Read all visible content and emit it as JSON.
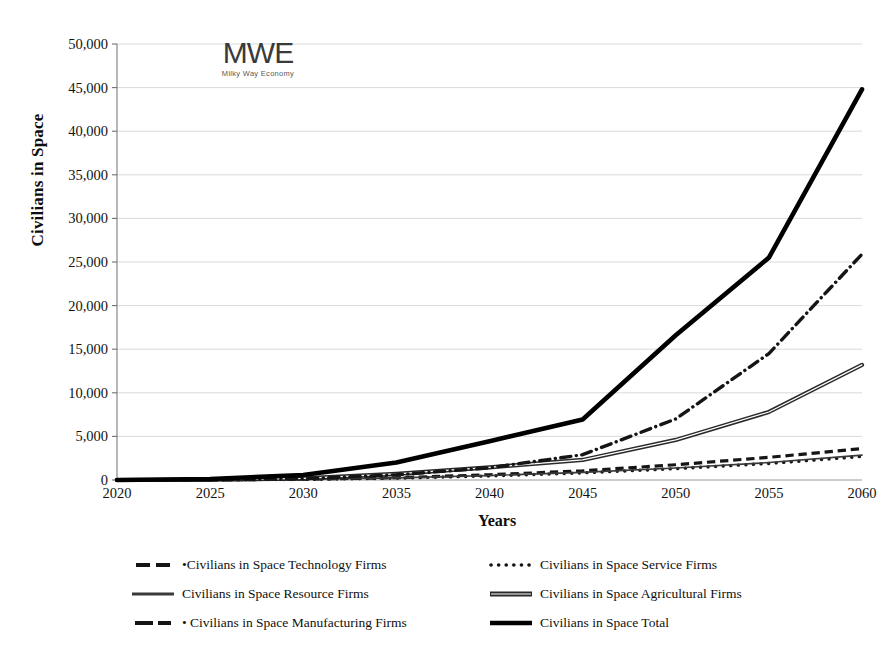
{
  "logo": {
    "mark": "MWE",
    "subtitle": "Milky Way Economy"
  },
  "axes": {
    "y_title": "Civilians in Space",
    "x_title": "Years"
  },
  "chart_data": {
    "type": "line",
    "title": "",
    "xlabel": "Years",
    "ylabel": "Civilians in Space",
    "x": [
      2020,
      2025,
      2030,
      2035,
      2040,
      2045,
      2050,
      2055,
      2060
    ],
    "xlim": [
      2020,
      2060
    ],
    "ylim": [
      0,
      50000
    ],
    "ytick_labels": [
      "50,000",
      "45,000",
      "40,000",
      "35,000",
      "30,000",
      "25,000",
      "20,000",
      "15,000",
      "10,000",
      "5,000",
      "0"
    ],
    "ytick_values": [
      50000,
      45000,
      40000,
      35000,
      30000,
      25000,
      20000,
      15000,
      10000,
      5000,
      0
    ],
    "xtick_labels": [
      "2020",
      "2025",
      "2030",
      "2035",
      "2040",
      "2045",
      "2050",
      "2055",
      "2060"
    ],
    "grid": true,
    "legend_position": "bottom",
    "series": [
      {
        "name": "Civilians in Space Technology Firms",
        "style": "dashed",
        "color": "#151515",
        "width": 3.2,
        "values": [
          0,
          20,
          90,
          260,
          600,
          1050,
          1750,
          2600,
          3600
        ]
      },
      {
        "name": "Civilians in Space Service Firms",
        "style": "dotted",
        "color": "#151515",
        "width": 3.4,
        "values": [
          0,
          15,
          70,
          210,
          470,
          820,
          1300,
          1900,
          2700
        ]
      },
      {
        "name": "Civilians in Space Resource Firms",
        "style": "solid-thin",
        "color": "#3a3a3a",
        "width": 1.6,
        "values": [
          0,
          18,
          80,
          240,
          520,
          880,
          1380,
          2000,
          2850
        ]
      },
      {
        "name": "Civilians in Space Agricultural Firms",
        "style": "double",
        "color": "#2a2a2a",
        "width": 2.6,
        "values": [
          0,
          30,
          180,
          700,
          1450,
          2300,
          4600,
          7800,
          13200
        ]
      },
      {
        "name": "Civilians in Space Manufacturing Firms",
        "style": "dash-dot",
        "color": "#151515",
        "width": 3.4,
        "values": [
          0,
          25,
          150,
          600,
          1400,
          2900,
          7000,
          14500,
          25900
        ]
      },
      {
        "name": "Civilians in Space Total",
        "style": "solid-thick",
        "color": "#000000",
        "width": 4.6,
        "values": [
          0,
          110,
          570,
          2010,
          4440,
          6940,
          16600,
          25500,
          44800
        ]
      }
    ]
  },
  "legend": {
    "left_column": [
      {
        "label": "•Civilians in Space Technology Firms",
        "series_index": 0
      },
      {
        "label": "Civilians in Space Resource Firms",
        "series_index": 2
      },
      {
        "label": "• Civilians in Space Manufacturing Firms",
        "series_index": 4
      }
    ],
    "right_column": [
      {
        "label": "Civilians in Space Service Firms",
        "series_index": 1
      },
      {
        "label": "Civilians in Space Agricultural Firms",
        "series_index": 3
      },
      {
        "label": "Civilians in Space Total",
        "series_index": 5
      }
    ]
  }
}
